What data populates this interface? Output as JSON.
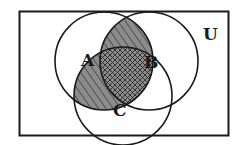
{
  "diagram": {
    "type": "venn",
    "universe_label": "U",
    "sets": [
      {
        "label": "A",
        "cx": 104,
        "cy": 61,
        "r": 49
      },
      {
        "label": "B",
        "cx": 149,
        "cy": 61,
        "r": 49
      },
      {
        "label": "C",
        "cx": 123,
        "cy": 96,
        "r": 49
      }
    ],
    "shaded_regions": [
      "A∩B",
      "A∩C"
    ],
    "cross_hatched_region": "A∩B∩C",
    "colors": {
      "stroke": "#1a1a1a",
      "shade_fill": "#8c8c8c",
      "hatch": "#2a2a2a",
      "background": "#ffffff"
    }
  }
}
